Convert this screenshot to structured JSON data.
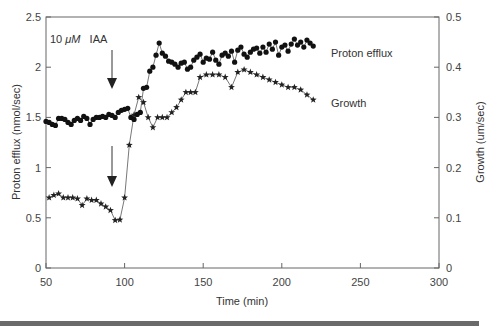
{
  "chart_data": {
    "type": "line",
    "title": "",
    "xlabel": "Time (min)",
    "ylabel": "Proton efflux (nmol/sec)",
    "ylabel_right": "Growth (um/sec)",
    "xlim": [
      50,
      300
    ],
    "ylim": [
      0,
      2.5
    ],
    "ylim_right": [
      0,
      0.5
    ],
    "xticks": [
      "50",
      "100",
      "150",
      "200",
      "250",
      "300"
    ],
    "yticks": [
      "0",
      "0.5",
      "1",
      "1.5",
      "2",
      "2.5"
    ],
    "yticks_right": [
      "0",
      "0.1",
      "0.2",
      "0.3",
      "0.4",
      "0.5"
    ],
    "grid": false,
    "annotations": [
      {
        "text": "10 μM IAA",
        "x": 93,
        "note": "arrows marking auxin addition on both curves"
      }
    ],
    "series": [
      {
        "name": "Proton efflux",
        "axis": "left",
        "marker": "filled-circle",
        "x": [
          50,
          52,
          54,
          56,
          58,
          60,
          62,
          64,
          66,
          68,
          70,
          72,
          74,
          76,
          78,
          80,
          82,
          84,
          86,
          88,
          90,
          92,
          94,
          96,
          98,
          100,
          102,
          104,
          106,
          108,
          110,
          112,
          114,
          116,
          118,
          120,
          122,
          124,
          126,
          128,
          130,
          132,
          134,
          136,
          138,
          140,
          142,
          144,
          146,
          148,
          150,
          152,
          154,
          156,
          158,
          160,
          162,
          164,
          166,
          168,
          170,
          172,
          174,
          176,
          178,
          180,
          182,
          184,
          186,
          188,
          190,
          192,
          194,
          196,
          198,
          200,
          202,
          204,
          206,
          208,
          210,
          212,
          214,
          216,
          218,
          220
        ],
        "values": [
          1.46,
          1.45,
          1.43,
          1.42,
          1.49,
          1.49,
          1.48,
          1.45,
          1.43,
          1.47,
          1.49,
          1.47,
          1.51,
          1.49,
          1.43,
          1.48,
          1.5,
          1.5,
          1.51,
          1.5,
          1.53,
          1.52,
          1.5,
          1.55,
          1.57,
          1.58,
          1.59,
          1.5,
          1.48,
          1.53,
          1.55,
          1.79,
          1.8,
          1.96,
          2.0,
          2.12,
          2.24,
          2.14,
          2.11,
          2.06,
          2.05,
          2.03,
          2.0,
          2.04,
          2.05,
          1.98,
          2.0,
          2.07,
          2.1,
          2.13,
          2.05,
          2.09,
          2.08,
          2.15,
          2.07,
          2.03,
          2.12,
          2.14,
          2.11,
          2.16,
          2.05,
          2.17,
          2.2,
          2.13,
          2.1,
          2.15,
          2.18,
          2.19,
          2.14,
          2.2,
          2.15,
          2.23,
          2.18,
          2.25,
          2.12,
          2.2,
          2.22,
          2.16,
          2.23,
          2.28,
          2.22,
          2.25,
          2.2,
          2.27,
          2.24,
          2.21
        ]
      },
      {
        "name": "Growth",
        "axis": "right",
        "marker": "star",
        "x": [
          52,
          55,
          58,
          61,
          64,
          67,
          70,
          73,
          76,
          79,
          82,
          85,
          88,
          91,
          94,
          97,
          100,
          103,
          106,
          109,
          112,
          115,
          118,
          121,
          124,
          127,
          130,
          133,
          136,
          139,
          142,
          145,
          148,
          152,
          156,
          160,
          164,
          168,
          172,
          176,
          180,
          184,
          188,
          192,
          196,
          200,
          204,
          208,
          212,
          216,
          220
        ],
        "values": [
          0.14,
          0.145,
          0.148,
          0.14,
          0.14,
          0.14,
          0.138,
          0.125,
          0.138,
          0.135,
          0.135,
          0.128,
          0.122,
          0.115,
          0.095,
          0.096,
          0.14,
          0.245,
          0.305,
          0.34,
          0.33,
          0.3,
          0.28,
          0.3,
          0.3,
          0.3,
          0.31,
          0.32,
          0.335,
          0.35,
          0.35,
          0.35,
          0.38,
          0.385,
          0.385,
          0.385,
          0.38,
          0.36,
          0.39,
          0.395,
          0.39,
          0.385,
          0.38,
          0.375,
          0.37,
          0.365,
          0.36,
          0.36,
          0.355,
          0.345,
          0.335
        ]
      }
    ]
  },
  "legend": {
    "proton_efflux": "Proton efflux",
    "growth": "Growth"
  },
  "annotation": {
    "concentration": "10",
    "unit": "μM",
    "compound": "IAA"
  },
  "axes": {
    "xlabel": "Time (min)",
    "ylabel_left": "Proton efflux (nmol/sec)",
    "ylabel_right": "Growth (um/sec)"
  }
}
